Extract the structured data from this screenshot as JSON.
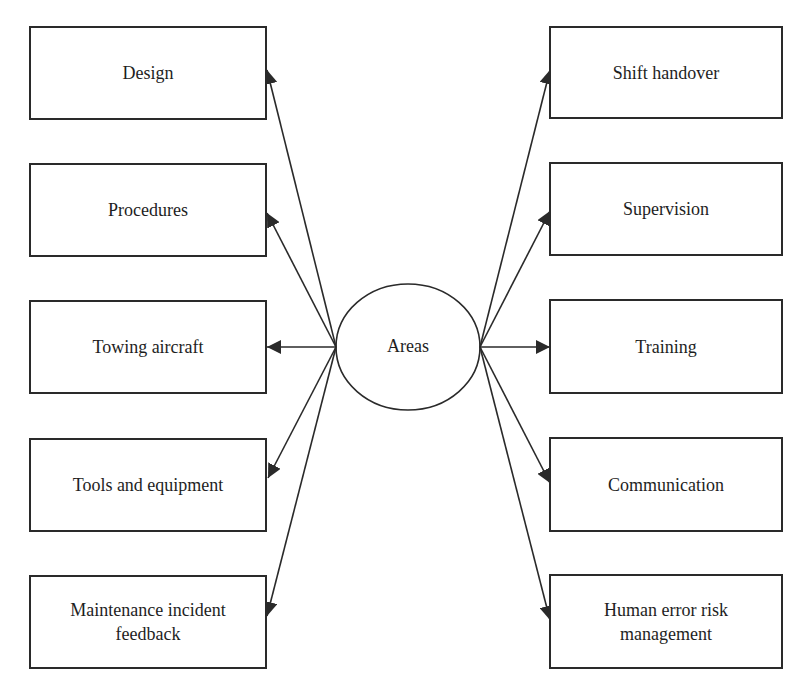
{
  "diagram": {
    "center": {
      "label": "Areas",
      "cx": 408,
      "cy": 347,
      "rx": 72,
      "ry": 63
    },
    "stroke_color": "#2a2a2a",
    "left_nodes": [
      {
        "id": "design",
        "label": "Design",
        "x": 29,
        "y": 26,
        "w": 238,
        "h": 94,
        "tip_x": 267,
        "tip_y": 70
      },
      {
        "id": "procedures",
        "label": "Procedures",
        "x": 29,
        "y": 163,
        "w": 238,
        "h": 94,
        "tip_x": 267,
        "tip_y": 213
      },
      {
        "id": "towing-aircraft",
        "label": "Towing aircraft",
        "x": 29,
        "y": 300,
        "w": 238,
        "h": 94,
        "tip_x": 267,
        "tip_y": 347
      },
      {
        "id": "tools-and-equipment",
        "label": "Tools and equipment",
        "x": 29,
        "y": 438,
        "w": 238,
        "h": 94,
        "tip_x": 268,
        "tip_y": 478
      },
      {
        "id": "maintenance-incident-feedback",
        "label": "Maintenance incident\nfeedback",
        "x": 29,
        "y": 575,
        "w": 238,
        "h": 94,
        "tip_x": 267,
        "tip_y": 616
      }
    ],
    "right_nodes": [
      {
        "id": "shift-handover",
        "label": "Shift handover",
        "x": 549,
        "y": 26,
        "w": 234,
        "h": 93,
        "tip_x": 550,
        "tip_y": 70
      },
      {
        "id": "supervision",
        "label": "Supervision",
        "x": 549,
        "y": 162,
        "w": 234,
        "h": 94,
        "tip_x": 550,
        "tip_y": 211
      },
      {
        "id": "training",
        "label": "Training",
        "x": 549,
        "y": 299,
        "w": 234,
        "h": 95,
        "tip_x": 550,
        "tip_y": 347
      },
      {
        "id": "communication",
        "label": "Communication",
        "x": 549,
        "y": 437,
        "w": 234,
        "h": 95,
        "tip_x": 550,
        "tip_y": 483
      },
      {
        "id": "human-error-risk-management",
        "label": "Human error risk\nmanagement",
        "x": 549,
        "y": 574,
        "w": 234,
        "h": 95,
        "tip_x": 550,
        "tip_y": 620
      }
    ],
    "left_origin": {
      "x": 336,
      "y": 347
    },
    "right_origin": {
      "x": 480,
      "y": 347
    }
  }
}
